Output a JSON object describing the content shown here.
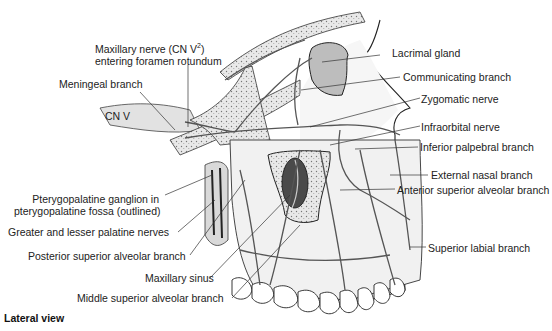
{
  "figure": {
    "view_caption": "Lateral view",
    "labels": {
      "maxillary_nerve_line1": "Maxillary nerve (CN V",
      "maxillary_nerve_sup": "2",
      "maxillary_nerve_close": ")",
      "maxillary_nerve_line2": "entering foramen rotundum",
      "meningeal_branch": "Meningeal branch",
      "cn_v": "CN V",
      "pterygopalatine_line1": "Pterygopalatine ganglion in",
      "pterygopalatine_line2": "pterygopalatine fossa (outlined)",
      "greater_lesser_palatine": "Greater and lesser palatine nerves",
      "posterior_superior_alveolar": "Posterior superior alveolar branch",
      "maxillary_sinus": "Maxillary sinus",
      "middle_superior_alveolar": "Middle superior alveolar branch",
      "lacrimal_gland": "Lacrimal gland",
      "communicating_branch": "Communicating branch",
      "zygomatic_nerve": "Zygomatic nerve",
      "infraorbital_nerve": "Infraorbital nerve",
      "inferior_palpebral": "Inferior palpebral branch",
      "external_nasal": "External nasal branch",
      "anterior_superior_alveolar": "Anterior superior alveolar branch",
      "superior_labial": "Superior labial branch"
    }
  }
}
